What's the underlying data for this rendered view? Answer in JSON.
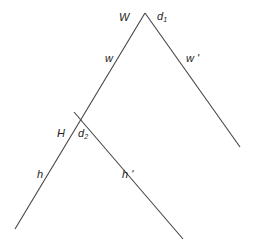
{
  "diagram": {
    "nodes": {
      "W": {
        "label": "W",
        "decision": "d",
        "decision_sub": "1"
      },
      "H": {
        "label": "H",
        "decision": "d",
        "decision_sub": "2"
      }
    },
    "edges": {
      "w": "w",
      "w_prime": "w '",
      "h": "h",
      "h_prime": "h '"
    }
  }
}
